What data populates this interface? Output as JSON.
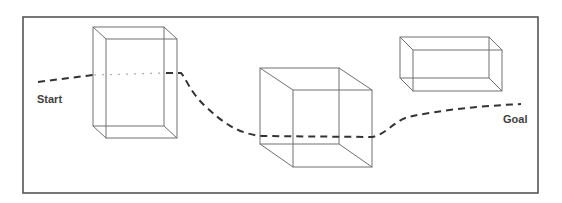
{
  "diagram": {
    "type": "path-planning-obstacles",
    "frame": {
      "x": 23,
      "y": 17,
      "width": 515,
      "height": 176,
      "stroke": "#555555"
    },
    "labels": {
      "start": "Start",
      "goal": "Goal"
    },
    "obstacles": [
      {
        "name": "tall-box",
        "back": {
          "x1": 93,
          "y1": 27,
          "x2": 164,
          "y2": 126
        },
        "front": {
          "x1": 106,
          "y1": 39,
          "x2": 177,
          "y2": 138
        }
      },
      {
        "name": "cube",
        "back": {
          "x1": 260,
          "y1": 68,
          "x2": 339,
          "y2": 144
        },
        "front": {
          "x1": 293,
          "y1": 90,
          "x2": 372,
          "y2": 167
        }
      },
      {
        "name": "flat-box",
        "back": {
          "x1": 400,
          "y1": 37,
          "x2": 489,
          "y2": 78
        },
        "front": {
          "x1": 413,
          "y1": 50,
          "x2": 502,
          "y2": 91
        }
      }
    ],
    "path": {
      "style": "dashed",
      "color": "#333333",
      "segments": [
        {
          "from": "start",
          "to": "tall-box",
          "visibility": "visible"
        },
        {
          "through": "tall-box",
          "visibility": "hidden-dotted"
        },
        {
          "from": "tall-box",
          "to": "goal",
          "visibility": "visible",
          "passes_behind": "cube"
        }
      ]
    }
  }
}
